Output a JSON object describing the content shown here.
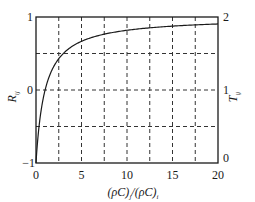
{
  "chart_data": {
    "type": "line",
    "title": "",
    "xlabel": "(ρC)_j/(ρC)_i",
    "ylabel_left": "R_ij",
    "ylabel_right": "T_ij",
    "xlim": [
      0,
      20
    ],
    "ylim_left": [
      -1,
      1
    ],
    "ylim_right": [
      0,
      2
    ],
    "x_ticks": [
      0,
      5,
      10,
      15,
      20
    ],
    "y_left_ticks": [
      -1,
      0,
      1
    ],
    "y_right_ticks": [
      0,
      1,
      2
    ],
    "grid": {
      "vertical_dashed_at_x": [
        2.5,
        5,
        7.5,
        10,
        12.5,
        15,
        17.5
      ],
      "horizontal_dashed_at_R": [
        -0.5,
        0,
        0.5
      ]
    },
    "legend": null,
    "series": [
      {
        "name": "R_ij = (x-1)/(x+1); T_ij = 1 + R_ij",
        "x": [
          0,
          0.25,
          0.5,
          1,
          1.5,
          2,
          3,
          4,
          5,
          6,
          8,
          10,
          12,
          14,
          16,
          18,
          20
        ],
        "values": [
          -1,
          -0.6,
          -0.333,
          0,
          0.2,
          0.333,
          0.5,
          0.6,
          0.667,
          0.714,
          0.778,
          0.818,
          0.846,
          0.867,
          0.882,
          0.895,
          0.905
        ]
      }
    ]
  },
  "labels": {
    "x_tick_0": "0",
    "x_tick_5": "5",
    "x_tick_10": "10",
    "x_tick_15": "15",
    "x_tick_20": "20",
    "yl_tick_1": "1",
    "yl_tick_0": "0",
    "yl_tick_m1": "−1",
    "yr_tick_2": "2",
    "yr_tick_1": "1",
    "yr_tick_0": "0",
    "ylabel_left_main": "R",
    "ylabel_left_sub": "ij",
    "ylabel_right_main": "T",
    "ylabel_right_sub": "ij",
    "xlabel_a": "(ρC)",
    "xlabel_a_sub": "j",
    "xlabel_mid": "/(ρC)",
    "xlabel_b_sub": "i"
  },
  "colors": {
    "line": "#1a1a1a",
    "grid": "#333333",
    "background": "#ffffff"
  }
}
